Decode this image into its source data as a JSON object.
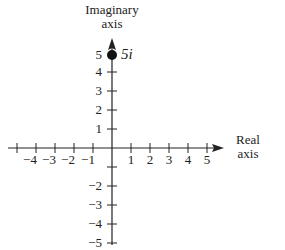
{
  "diagram": {
    "imag_axis_label": [
      "Imaginary",
      "axis"
    ],
    "real_axis_label": [
      "Real",
      "axis"
    ],
    "x_ticks": [
      "−4",
      "−3",
      "−2",
      "−1",
      "1",
      "2",
      "3",
      "4",
      "5"
    ],
    "y_ticks_pos": [
      "5",
      "4",
      "3",
      "2",
      "1"
    ],
    "y_ticks_neg": [
      "−2",
      "−3",
      "−4",
      "−5"
    ],
    "point": {
      "re": 0,
      "im": 5,
      "label": "5i"
    },
    "colors": {
      "ink": "#222222",
      "background": "#ffffff"
    }
  }
}
